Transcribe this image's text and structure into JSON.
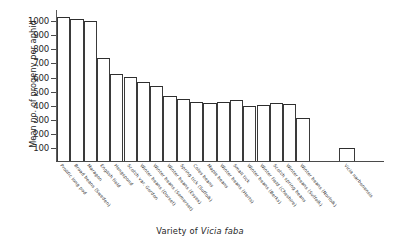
{
  "chart_data": {
    "type": "bar",
    "title": "",
    "xlabel_prefix": "Variety of ",
    "xlabel_species": "Vicia faba",
    "xlabel": "Variety of Vicia faba",
    "ylabel": "Mean no. of progeny per aphid",
    "ylim": [
      0,
      1080
    ],
    "ytick_values": [
      100,
      200,
      300,
      400,
      500,
      600,
      700,
      800,
      900,
      1000
    ],
    "ytick_labels": [
      "100",
      "200",
      "300",
      "400",
      "500",
      "600",
      "700",
      "800",
      "900",
      "1000"
    ],
    "grid": false,
    "legend": "none",
    "categories": [
      "Prolific long pod",
      "Broad beans (Sweden)",
      "Maragon",
      "English field",
      "Hengspond",
      "Scotch var. Gordon",
      "Winter beans (Dorset)",
      "Winter beans (Somerset)",
      "Winter beans (Essex)",
      "Spring tick (Suffolk)",
      "Coles beans",
      "Maple beans",
      "Winter beans (Herts)",
      "Small tick",
      "Winter beans (Berks)",
      "Winter field (Cheshire)",
      "Scotch spring beans",
      "Winter beans (Suffolk)",
      "Winter beans (Norfolk)",
      "Spring beans (Kent)",
      "Vicia narbonensis"
    ],
    "values": [
      1030,
      1015,
      1005,
      735,
      620,
      598,
      565,
      533,
      462,
      440,
      422,
      417,
      420,
      435,
      393,
      398,
      412,
      408,
      307,
      0,
      92
    ],
    "bar_count": 21,
    "last_bar_separated": true
  },
  "chart_bars": [
    {
      "label": "Prolific long pod",
      "value": 1030
    },
    {
      "label": "Broad beans (Sweden)",
      "value": 1015
    },
    {
      "label": "Maragon",
      "value": 1005
    },
    {
      "label": "English field",
      "value": 735
    },
    {
      "label": "Hengspond",
      "value": 620
    },
    {
      "label": "Scotch var. Gordon",
      "value": 598
    },
    {
      "label": "Winter beans (Dorset)",
      "value": 565
    },
    {
      "label": "Winter beans (Somerset)",
      "value": 533
    },
    {
      "label": "Winter beans (Essex)",
      "value": 462
    },
    {
      "label": "Spring tick (Suffolk)",
      "value": 440
    },
    {
      "label": "Coles beans",
      "value": 422
    },
    {
      "label": "Maple beans",
      "value": 417
    },
    {
      "label": "Winter beans (Herts)",
      "value": 420
    },
    {
      "label": "Small tick",
      "value": 435
    },
    {
      "label": "Winter beans (Berks)",
      "value": 393
    },
    {
      "label": "Winter field (Cheshire)",
      "value": 398
    },
    {
      "label": "Scotch spring beans",
      "value": 412
    },
    {
      "label": "Winter beans (Suffolk)",
      "value": 408
    },
    {
      "label": "Winter beans (Norfolk)",
      "value": 307
    },
    {
      "label": "Vicia narbonensis",
      "value": 92
    }
  ],
  "style": {
    "bar_edge_color": "#2e2e2e",
    "bar_fill_color": "#ffffff",
    "axis_color": "#4a4a4a",
    "text_color": "#262626",
    "background": "#ffffff"
  }
}
